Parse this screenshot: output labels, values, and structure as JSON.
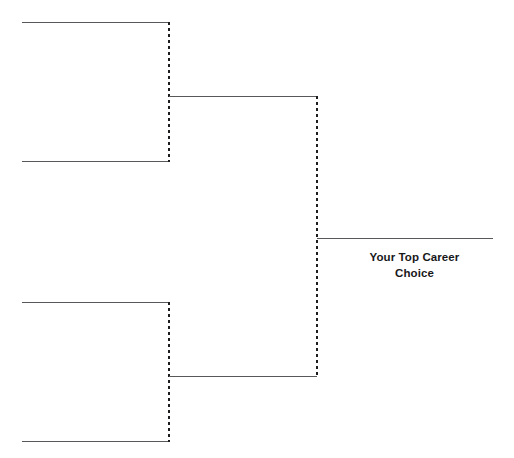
{
  "diagram": {
    "title": "Your Top Career Choice",
    "type": "single-elimination-bracket",
    "canvas": {
      "width": 514,
      "height": 458,
      "background": "#ffffff"
    },
    "colors": {
      "solid_line": "#58585a",
      "dashed_line": "#1d1d1f",
      "text": "#18181a",
      "background": "#ffffff"
    },
    "final_label": {
      "line1": "Your Top Career",
      "line2": "Choice"
    },
    "rounds": [
      {
        "name": "round-1",
        "slot_count": 4,
        "slots": [
          {
            "id": "slot-1",
            "label": "",
            "x1": 22,
            "x2": 169,
            "y": 22
          },
          {
            "id": "slot-2",
            "label": "",
            "x1": 22,
            "x2": 169,
            "y": 161
          },
          {
            "id": "slot-3",
            "label": "",
            "x1": 22,
            "x2": 169,
            "y": 302
          },
          {
            "id": "slot-4",
            "label": "",
            "x1": 22,
            "x2": 169,
            "y": 441
          }
        ],
        "connectors": [
          {
            "id": "connector-top",
            "x": 169,
            "y1": 22,
            "y2": 161,
            "style": "dashed"
          },
          {
            "id": "connector-bottom",
            "x": 169,
            "y1": 302,
            "y2": 441,
            "style": "dashed"
          }
        ]
      },
      {
        "name": "round-2",
        "slot_count": 2,
        "slots": [
          {
            "id": "slot-5",
            "label": "",
            "x1": 169,
            "x2": 317,
            "y": 96
          },
          {
            "id": "slot-6",
            "label": "",
            "x1": 169,
            "x2": 317,
            "y": 376
          }
        ],
        "connectors": [
          {
            "id": "connector-center",
            "x": 317,
            "y1": 96,
            "y2": 376,
            "style": "dashed"
          }
        ]
      },
      {
        "name": "final",
        "slot_count": 1,
        "slots": [
          {
            "id": "slot-7",
            "label": "Your Top Career Choice",
            "x1": 317,
            "x2": 493,
            "y": 238
          }
        ],
        "connectors": []
      }
    ]
  }
}
